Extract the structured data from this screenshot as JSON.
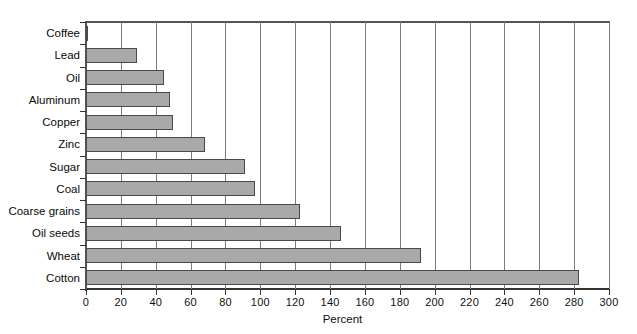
{
  "chart_data": {
    "type": "bar",
    "orientation": "horizontal",
    "title": "",
    "xlabel": "Percent",
    "ylabel": "",
    "xlim": [
      0,
      300
    ],
    "xticks": [
      0,
      20,
      40,
      60,
      80,
      100,
      120,
      140,
      160,
      180,
      200,
      220,
      240,
      260,
      280,
      300
    ],
    "grid": true,
    "legend": false,
    "categories": [
      "Coffee",
      "Lead",
      "Oil",
      "Aluminum",
      "Copper",
      "Zinc",
      "Sugar",
      "Coal",
      "Coarse grains",
      "Oil seeds",
      "Wheat",
      "Cotton"
    ],
    "values": [
      1,
      29,
      45,
      48,
      50,
      68,
      91,
      97,
      123,
      146,
      192,
      283
    ],
    "bar_color": "#a9a9a9",
    "bar_edge_color": "#4a4a4a",
    "gridline_color": "#7c7c7c",
    "axis_color": "#333333"
  }
}
